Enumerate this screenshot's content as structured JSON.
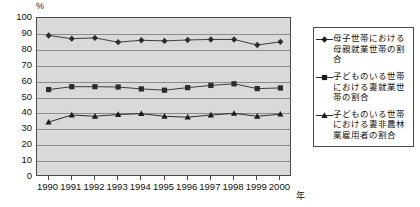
{
  "chart_data": {
    "type": "line",
    "title": "",
    "xlabel": "年",
    "ylabel": "%",
    "ylim": [
      0,
      100
    ],
    "ytick_step": 10,
    "grid": true,
    "legend_position": "right",
    "categories": [
      "1990",
      "1991",
      "1992",
      "1993",
      "1994",
      "1995",
      "1996",
      "1997",
      "1998",
      "1999",
      "2000"
    ],
    "series": [
      {
        "name": "母子世帯における母親就業世帯の割合",
        "marker": "diamond",
        "color": "#2b2b2b",
        "values": [
          89.0,
          87.0,
          87.5,
          84.8,
          86.0,
          85.6,
          86.2,
          86.5,
          86.5,
          83.0,
          85.0
        ]
      },
      {
        "name": "子どものいる世帯における妻就業世帯の割合",
        "marker": "square",
        "color": "#2b2b2b",
        "values": [
          55.0,
          56.8,
          56.8,
          56.6,
          55.4,
          54.6,
          56.2,
          57.6,
          58.6,
          55.6,
          56.0
        ]
      },
      {
        "name": "子どものいる世帯における妻非農林業雇用者の割合",
        "marker": "triangle",
        "color": "#1a1a1a",
        "values": [
          34.5,
          39.0,
          38.2,
          39.3,
          39.8,
          38.2,
          37.6,
          39.0,
          40.0,
          38.2,
          39.5
        ]
      }
    ]
  },
  "axis": {
    "y_unit": "%",
    "x_unit": "年",
    "y_ticks": [
      "100",
      "90",
      "80",
      "70",
      "60",
      "50",
      "40",
      "30",
      "20",
      "10",
      "0"
    ],
    "x_ticks": [
      "1990",
      "1991",
      "1992",
      "1993",
      "1994",
      "1995",
      "1996",
      "1997",
      "1998",
      "1999",
      "2000"
    ]
  },
  "legend": {
    "items": [
      {
        "label": "母子世帯における母親就業世帯の割合",
        "marker": "diamond"
      },
      {
        "label": "子どものいる世帯における妻就業世帯の割合",
        "marker": "square"
      },
      {
        "label": "子どものいる世帯における妻非農林業雇用者の割合",
        "marker": "triangle"
      }
    ]
  }
}
